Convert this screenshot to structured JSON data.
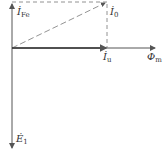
{
  "diagram": {
    "type": "phasor",
    "labels": {
      "i_fe": {
        "main": "İ",
        "sub": "Fe"
      },
      "i_0": {
        "main": "İ",
        "sub": "0"
      },
      "i_u": {
        "main": "İ",
        "sub": "u"
      },
      "phi_m": {
        "main": "Φ",
        "sub": "m"
      },
      "e_1": {
        "main": "Ė",
        "sub": "1"
      }
    },
    "colors": {
      "line": "#555555",
      "text": "#333333"
    }
  }
}
